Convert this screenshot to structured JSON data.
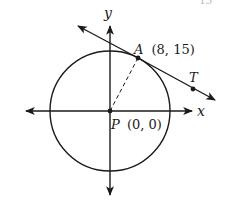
{
  "figure": {
    "type": "coordinate geometry diagram",
    "cutoff_text": "15",
    "axes": {
      "x_label": "x",
      "y_label": "y"
    },
    "circle": {
      "center_label": "P",
      "center_coords": "(0, 0)"
    },
    "points": [
      {
        "name": "A",
        "coords": "(8, 15)",
        "role": "point of tangency"
      },
      {
        "name": "T",
        "coords": "",
        "role": "point on tangent line"
      },
      {
        "name": "P",
        "coords": "(0, 0)",
        "role": "center"
      }
    ],
    "segments": [
      {
        "from": "P",
        "to": "A",
        "style": "dashed",
        "role": "radius"
      }
    ],
    "lines": [
      {
        "name": "tangent",
        "through": [
          "A",
          "T"
        ],
        "arrows": "both ends"
      }
    ],
    "colors": {
      "stroke": "#1a1a1a",
      "background": "#ffffff"
    }
  }
}
